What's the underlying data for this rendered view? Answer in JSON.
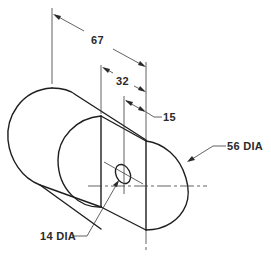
{
  "figure": {
    "type": "isometric engineering drawing"
  },
  "dimensions": {
    "overall_length": "67",
    "flat_length": "32",
    "hole_offset": "15",
    "cylinder_diameter": "56 DIA",
    "hole_diameter": "14 DIA"
  },
  "colors": {
    "line": "#1e1e1e",
    "text": "#2a2a2a",
    "background": "#ffffff"
  }
}
